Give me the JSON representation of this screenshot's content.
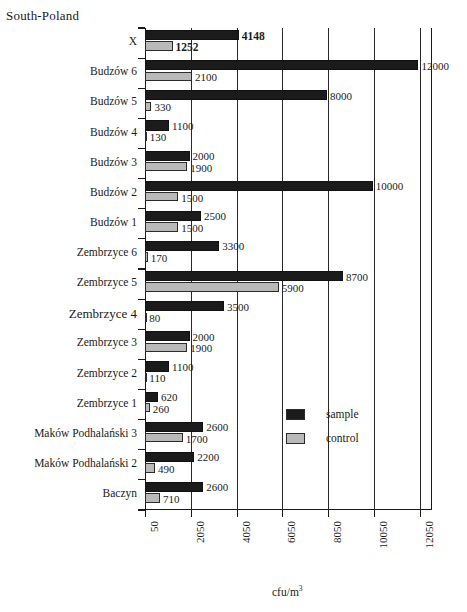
{
  "chart_data": {
    "type": "bar",
    "orientation": "horizontal",
    "title": "South-Poland",
    "xlabel": "cfu/m3",
    "xlabel_display": "cfu/m",
    "xlabel_sup": "3",
    "ylabel": "",
    "xlim": [
      50,
      12550
    ],
    "xticks": [
      50,
      2050,
      4050,
      6050,
      8050,
      10050,
      12050
    ],
    "xticklabels": [
      "50",
      "2050",
      "4050",
      "6050",
      "8050",
      "10050",
      "12050"
    ],
    "grid": true,
    "grid_axis": "x",
    "legend_position": "center-right-inside",
    "categories": [
      "X",
      "Budzów 6",
      "Budzów 5",
      "Budzów 4",
      "Budzów 3",
      "Budzów 2",
      "Budzów 1",
      "Zembrzyce 6",
      "Zembrzyce 5",
      "Zembrzyce 4",
      "Zembrzyce 3",
      "Zembrzyce 2",
      "Zembrzyce 1",
      "Maków Podhalański 3",
      "Maków Podhalański 2",
      "Baczyn"
    ],
    "series": [
      {
        "name": "sample",
        "color": "#1b1b1b",
        "values": [
          4148,
          12000,
          8000,
          1100,
          2000,
          10000,
          2500,
          3300,
          8700,
          3500,
          2000,
          1100,
          620,
          2600,
          2200,
          2600
        ]
      },
      {
        "name": "control",
        "color": "#b9b9b9",
        "values": [
          1252,
          2100,
          330,
          130,
          1900,
          1500,
          1500,
          170,
          5900,
          80,
          1900,
          110,
          260,
          1700,
          490,
          710
        ]
      }
    ],
    "rows": [
      {
        "category": "X",
        "label_size": "normal",
        "sample": 4148,
        "control": 1252,
        "sample_text": "4148",
        "control_text": "1252",
        "emphasis": true
      },
      {
        "category": "Budzów 6",
        "label_size": "normal",
        "sample": 12000,
        "control": 2100,
        "sample_text": "12000",
        "control_text": "2100",
        "emphasis": false
      },
      {
        "category": "Budzów 5",
        "label_size": "normal",
        "sample": 8000,
        "control": 330,
        "sample_text": "8000",
        "control_text": "330",
        "emphasis": false
      },
      {
        "category": "Budzów 4",
        "label_size": "normal",
        "sample": 1100,
        "control": 130,
        "sample_text": "1100",
        "control_text": "130",
        "emphasis": false
      },
      {
        "category": "Budzów 3",
        "label_size": "normal",
        "sample": 2000,
        "control": 1900,
        "sample_text": "2000",
        "control_text": "1900",
        "emphasis": false
      },
      {
        "category": "Budzów 2",
        "label_size": "normal",
        "sample": 10000,
        "control": 1500,
        "sample_text": "10000",
        "control_text": "1500",
        "emphasis": false
      },
      {
        "category": "Budzów 1",
        "label_size": "normal",
        "sample": 2500,
        "control": 1500,
        "sample_text": "2500",
        "control_text": "1500",
        "emphasis": false
      },
      {
        "category": "Zembrzyce 6",
        "label_size": "normal",
        "sample": 3300,
        "control": 170,
        "sample_text": "3300",
        "control_text": "170",
        "emphasis": false
      },
      {
        "category": "Zembrzyce 5",
        "label_size": "normal",
        "sample": 8700,
        "control": 5900,
        "sample_text": "8700",
        "control_text": "5900",
        "emphasis": false
      },
      {
        "category": "Zembrzyce 4",
        "label_size": "big",
        "sample": 3500,
        "control": 80,
        "sample_text": "3500",
        "control_text": "80",
        "emphasis": false
      },
      {
        "category": "Zembrzyce 3",
        "label_size": "normal",
        "sample": 2000,
        "control": 1900,
        "sample_text": "2000",
        "control_text": "1900",
        "emphasis": false
      },
      {
        "category": "Zembrzyce 2",
        "label_size": "normal",
        "sample": 1100,
        "control": 110,
        "sample_text": "1100",
        "control_text": "110",
        "emphasis": false
      },
      {
        "category": "Zembrzyce 1",
        "label_size": "normal",
        "sample": 620,
        "control": 260,
        "sample_text": "620",
        "control_text": "260",
        "emphasis": false
      },
      {
        "category": "Maków Podhalański 3",
        "label_size": "normal",
        "sample": 2600,
        "control": 1700,
        "sample_text": "2600",
        "control_text": "1700",
        "emphasis": false
      },
      {
        "category": "Maków Podhalański 2",
        "label_size": "normal",
        "sample": 2200,
        "control": 490,
        "sample_text": "2200",
        "control_text": "490",
        "emphasis": false
      },
      {
        "category": "Baczyn",
        "label_size": "normal",
        "sample": 2600,
        "control": 710,
        "sample_text": "2600",
        "control_text": "710",
        "emphasis": false
      }
    ],
    "legend": [
      {
        "label": "sample",
        "color": "#1b1b1b"
      },
      {
        "label": "control",
        "color": "#b9b9b9"
      }
    ]
  }
}
